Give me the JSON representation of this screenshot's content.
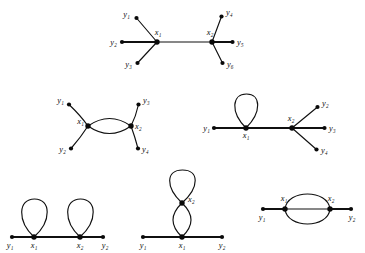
{
  "figure": {
    "title": "",
    "background_color": "#ffffff",
    "stroke_color": "#101010",
    "node_color": "#0a0a0a",
    "label_color": "#0d0d0d"
  },
  "diagrams": [
    {
      "id": "diagram-top-tree",
      "name": "two-center-tree-six-leaves",
      "description": "Tree with two adjacent internal vertices x1 and x2, each of degree 3 with three pendant leaves",
      "centers": [
        {
          "label": "x",
          "sub": "1",
          "text": "x₁",
          "x": 157,
          "y": 42
        },
        {
          "label": "x",
          "sub": "2",
          "text": "x₂",
          "x": 212,
          "y": 42
        }
      ],
      "leaves": [
        {
          "label": "y",
          "sub": "1",
          "text": "y₁",
          "x": 136,
          "y": 17
        },
        {
          "label": "y",
          "sub": "2",
          "text": "y₂",
          "x": 122,
          "y": 42
        },
        {
          "label": "y",
          "sub": "3",
          "text": "y₃",
          "x": 137,
          "y": 64
        },
        {
          "label": "y",
          "sub": "4",
          "text": "y₄",
          "x": 222,
          "y": 15
        },
        {
          "label": "y",
          "sub": "5",
          "text": "y₅",
          "x": 233,
          "y": 42
        },
        {
          "label": "y",
          "sub": "6",
          "text": "y₆",
          "x": 223,
          "y": 64
        }
      ]
    },
    {
      "id": "diagram-mid-left-double-edge",
      "name": "double-edge-with-four-leaves",
      "description": "x1 and x2 joined by a double edge (lens), each with two pendant leaves",
      "centers": [
        {
          "label": "x",
          "sub": "1",
          "text": "x₁",
          "x": 88,
          "y": 126
        },
        {
          "label": "x",
          "sub": "2",
          "text": "x₂",
          "x": 131,
          "y": 126
        }
      ],
      "leaves": [
        {
          "label": "y",
          "sub": "1",
          "text": "y₁",
          "x": 68,
          "y": 103
        },
        {
          "label": "y",
          "sub": "2",
          "text": "y₂",
          "x": 70,
          "y": 150
        },
        {
          "label": "y",
          "sub": "3",
          "text": "y₃",
          "x": 139,
          "y": 103
        },
        {
          "label": "y",
          "sub": "4",
          "text": "y₄",
          "x": 138,
          "y": 150
        }
      ]
    },
    {
      "id": "diagram-mid-right-loop",
      "name": "loop-at-x1-star-at-x2",
      "description": "x1 carries a loop and one pendant leaf y1; x2 has three pendant leaves y2, y3, y4",
      "centers": [
        {
          "label": "x",
          "sub": "1",
          "text": "x₁",
          "x": 246,
          "y": 128
        },
        {
          "label": "x",
          "sub": "2",
          "text": "x₂",
          "x": 292,
          "y": 128
        }
      ],
      "leaves": [
        {
          "label": "y",
          "sub": "1",
          "text": "y₁",
          "x": 214,
          "y": 128
        },
        {
          "label": "y",
          "sub": "2",
          "text": "y₂",
          "x": 318,
          "y": 106
        },
        {
          "label": "y",
          "sub": "3",
          "text": "y₃",
          "x": 325,
          "y": 128
        },
        {
          "label": "y",
          "sub": "4",
          "text": "y₄",
          "x": 317,
          "y": 150
        }
      ]
    },
    {
      "id": "diagram-bottom-left-two-loops",
      "name": "two-separate-loops-on-path",
      "description": "Path y1-x1-x2-y2 with a loop at x1 and a loop at x2",
      "centers": [
        {
          "label": "x",
          "sub": "1",
          "text": "x₁",
          "x": 34,
          "y": 237
        },
        {
          "label": "x",
          "sub": "2",
          "text": "x₂",
          "x": 80,
          "y": 237
        }
      ],
      "leaves": [
        {
          "label": "y",
          "sub": "1",
          "text": "y₁",
          "x": 12,
          "y": 237
        },
        {
          "label": "y",
          "sub": "2",
          "text": "y₂",
          "x": 103,
          "y": 237
        }
      ]
    },
    {
      "id": "diagram-bottom-middle-stacked",
      "name": "double-edge-plus-loop-stacked",
      "description": "x1 on the base path joined to x2 above by a double edge; x2 carries a loop",
      "centers": [
        {
          "label": "x",
          "sub": "1",
          "text": "x₁",
          "x": 182,
          "y": 237
        },
        {
          "label": "x",
          "sub": "2",
          "text": "x₂",
          "x": 182,
          "y": 203
        }
      ],
      "leaves": [
        {
          "label": "y",
          "sub": "1",
          "text": "y₁",
          "x": 143,
          "y": 237
        },
        {
          "label": "y",
          "sub": "2",
          "text": "y₂",
          "x": 222,
          "y": 237
        }
      ]
    },
    {
      "id": "diagram-bottom-right-triple-edge",
      "name": "triple-edge-between-x1-x2",
      "description": "x1 and x2 joined by three parallel edges, each with one pendant leaf",
      "centers": [
        {
          "label": "x",
          "sub": "1",
          "text": "x₁",
          "x": 285,
          "y": 209
        },
        {
          "label": "x",
          "sub": "2",
          "text": "x₂",
          "x": 330,
          "y": 209
        }
      ],
      "leaves": [
        {
          "label": "y",
          "sub": "1",
          "text": "y₁",
          "x": 263,
          "y": 209
        },
        {
          "label": "y",
          "sub": "2",
          "text": "y₂",
          "x": 351,
          "y": 209
        }
      ]
    }
  ],
  "labels": {
    "d1_x1": "x₁",
    "d1_x2": "x₂",
    "d1_y1": "y₁",
    "d1_y2": "y₂",
    "d1_y3": "y₃",
    "d1_y4": "y₄",
    "d1_y5": "y₅",
    "d1_y6": "y₆",
    "d2_x1": "x₁",
    "d2_x2": "x₂",
    "d2_y1": "y₁",
    "d2_y2": "y₂",
    "d2_y3": "y₃",
    "d2_y4": "y₄",
    "d3_x1": "x₁",
    "d3_x2": "x₂",
    "d3_y1": "y₁",
    "d3_y2": "y₂",
    "d3_y3": "y₃",
    "d3_y4": "y₄",
    "d4_x1": "x₁",
    "d4_x2": "x₂",
    "d4_y1": "y₁",
    "d4_y2": "y₂",
    "d5_x1": "x₁",
    "d5_x2": "x₂",
    "d5_y1": "y₁",
    "d5_y2": "y₂",
    "d6_x1": "x₁",
    "d6_x2": "x₂",
    "d6_y1": "y₁",
    "d6_y2": "y₂"
  }
}
